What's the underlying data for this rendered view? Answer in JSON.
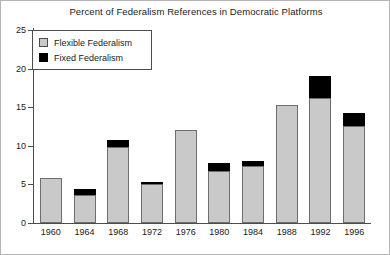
{
  "chart_data": {
    "type": "bar",
    "title": "Percent of Federalism References in Democratic Platforms",
    "xlabel": "",
    "ylabel": "",
    "ylim": [
      0,
      25
    ],
    "yticks": [
      0,
      5,
      10,
      15,
      20,
      25
    ],
    "grid": false,
    "stacked": true,
    "legend_position": "top-left",
    "categories": [
      "1960",
      "1964",
      "1968",
      "1972",
      "1976",
      "1980",
      "1984",
      "1988",
      "1992",
      "1996"
    ],
    "series": [
      {
        "name": "Flexible Federalism",
        "color": "#c9c9c9",
        "values": [
          5.8,
          3.6,
          9.9,
          5.0,
          12.1,
          6.8,
          7.4,
          15.3,
          16.2,
          12.6
        ]
      },
      {
        "name": "Fixed Federalism",
        "color": "#000000",
        "values": [
          0.0,
          0.8,
          0.9,
          0.2,
          0.0,
          1.0,
          0.6,
          0.0,
          2.8,
          1.6
        ]
      }
    ],
    "totals": [
      5.8,
      4.4,
      10.8,
      5.2,
      12.1,
      7.8,
      8.0,
      15.3,
      19.0,
      14.2
    ]
  },
  "legend": {
    "items": [
      {
        "label": "Flexible Federalism",
        "swatch": "light-gray-square"
      },
      {
        "label": "Fixed Federalism",
        "swatch": "black-square"
      }
    ]
  }
}
